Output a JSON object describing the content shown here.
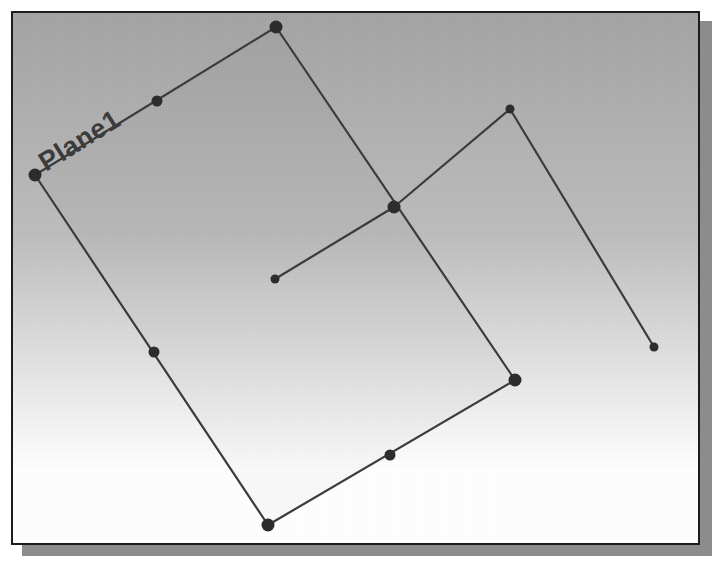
{
  "window": {
    "frame_border_color": "#1c1c1c",
    "shadow_color": "#8c8c8c",
    "page_background": "#ffffff"
  },
  "viewport": {
    "name": "model-viewport",
    "width": 685,
    "height": 530,
    "background_gradient": {
      "type": "vertical",
      "top_color": "#a4a4a4",
      "mid_color": "#bdbdbd",
      "bottom_color": "#ffffff"
    },
    "geometry_stroke_color": "#3a3a3a",
    "control_point_color": "#2b2b2b",
    "label_color": "#3a3a3a"
  },
  "entities": {
    "plane": {
      "label": "Plane1",
      "label_rotation_deg": -32,
      "label_x": 44,
      "label_y": 170,
      "type": "quadrilateral",
      "vertices": [
        {
          "name": "corner-top",
          "x": 274,
          "y": 25
        },
        {
          "name": "corner-right",
          "x": 513,
          "y": 378
        },
        {
          "name": "corner-bottom",
          "x": 266,
          "y": 523
        },
        {
          "name": "corner-left",
          "x": 33,
          "y": 173
        }
      ],
      "edge_midpoints": [
        {
          "name": "midpoint-top-left",
          "x": 155,
          "y": 99
        },
        {
          "name": "midpoint-left-bottom",
          "x": 152,
          "y": 350
        },
        {
          "name": "midpoint-bottom-right",
          "x": 388,
          "y": 453
        }
      ]
    },
    "polyline": {
      "name": "Polyline1",
      "points": [
        {
          "name": "polyline-start",
          "x": 273,
          "y": 277,
          "dot": "small"
        },
        {
          "name": "polyline-vertex",
          "x": 392,
          "y": 205,
          "dot": "large"
        },
        {
          "name": "polyline-apex",
          "x": 508,
          "y": 107,
          "dot": "small"
        },
        {
          "name": "polyline-end",
          "x": 652,
          "y": 345,
          "dot": "small"
        }
      ]
    }
  }
}
